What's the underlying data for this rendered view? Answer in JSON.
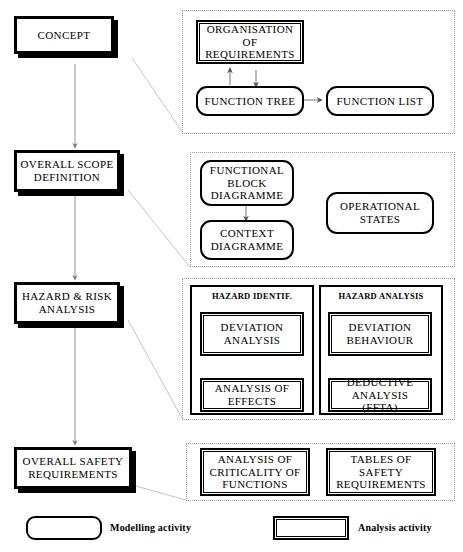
{
  "diagram": {
    "legend": {
      "modelling": {
        "label": "Modelling activity",
        "shape": "rounded-rectangle"
      },
      "analysis": {
        "label": "Analysis activity",
        "shape": "rectangle"
      }
    },
    "stages": [
      {
        "id": "concept",
        "label": "CONCEPT"
      },
      {
        "id": "overall-scope-definition",
        "label": "OVERALL SCOPE DEFINITION"
      },
      {
        "id": "hazard-risk-analysis",
        "label": "HAZARD & RISK ANALYSIS"
      },
      {
        "id": "overall-safety-requirements",
        "label": "OVERALL SAFETY REQUIREMENTS"
      }
    ],
    "regions": [
      {
        "id": "concept-activities",
        "activities": [
          {
            "id": "organisation-of-requirements",
            "label": "ORGANISATION OF REQUIREMENTS",
            "kind": "analysis"
          },
          {
            "id": "function-tree",
            "label": "FUNCTION TREE",
            "kind": "modelling"
          },
          {
            "id": "function-list",
            "label": "FUNCTION LIST",
            "kind": "modelling"
          }
        ]
      },
      {
        "id": "scope-activities",
        "activities": [
          {
            "id": "functional-block-diagramme",
            "label": "FUNCTIONAL BLOCK DIAGRAMME",
            "kind": "modelling"
          },
          {
            "id": "context-diagramme",
            "label": "CONTEXT DIAGRAMME",
            "kind": "modelling"
          },
          {
            "id": "operational-states",
            "label": "OPERATIONAL STATES",
            "kind": "modelling"
          }
        ]
      },
      {
        "id": "hazard-activities",
        "subgroups": [
          {
            "id": "hazard-identif",
            "title": "HAZARD IDENTIF.",
            "activities": [
              {
                "id": "deviation-analysis",
                "label": "DEVIATION ANALYSIS",
                "kind": "analysis"
              },
              {
                "id": "analysis-of-effects",
                "label": "ANALYSIS OF EFFECTS",
                "kind": "analysis"
              }
            ]
          },
          {
            "id": "hazard-analysis",
            "title": "HAZARD ANALYSIS",
            "activities": [
              {
                "id": "deviation-behaviour",
                "label": "DEVIATION BEHAVIOUR",
                "kind": "analysis"
              },
              {
                "id": "deductive-analysis-ffta",
                "label": "DEDUCTIVE ANALYSIS (FFTA)",
                "kind": "analysis"
              }
            ]
          }
        ]
      },
      {
        "id": "safety-requirements-activities",
        "activities": [
          {
            "id": "analysis-of-criticality-of-functions",
            "label": "ANALYSIS OF CRITICALITY OF FUNCTIONS",
            "kind": "analysis"
          },
          {
            "id": "tables-of-safety-requirements",
            "label": "TABLES OF SAFETY REQUIREMENTS",
            "kind": "analysis"
          }
        ]
      }
    ],
    "colors": {
      "line": "#000000",
      "region_border": "#9a9a9a",
      "connector": "#a8a8a8",
      "background": "#ffffff"
    }
  }
}
